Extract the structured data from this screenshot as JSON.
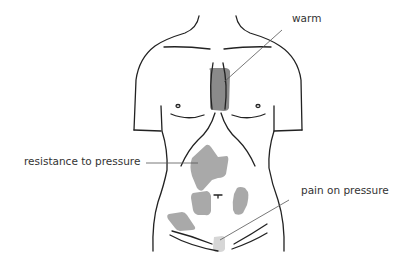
{
  "figure": {
    "background": "#ffffff",
    "colors": {
      "outline": "#222222",
      "leader_line": "#555555",
      "region_dark": "#8a8a8a",
      "region_medium": "#a9a9a9",
      "region_light": "#d6d6d6"
    }
  },
  "labels": {
    "warm": "warm",
    "resistance": "resistance to pressure",
    "pain": "pain on pressure"
  },
  "regions": [
    {
      "name": "sternum-area",
      "finding": "warm",
      "shade": "dark"
    },
    {
      "name": "upper-abdomen",
      "finding": "resistance to pressure",
      "shade": "medium"
    },
    {
      "name": "left-mid-abdomen",
      "finding": "resistance to pressure",
      "shade": "medium"
    },
    {
      "name": "right-mid-abdomen",
      "finding": "resistance to pressure",
      "shade": "medium"
    },
    {
      "name": "lower-left-abdomen",
      "finding": "resistance to pressure",
      "shade": "medium"
    },
    {
      "name": "suprapubic-area",
      "finding": "pain on pressure",
      "shade": "light"
    }
  ]
}
